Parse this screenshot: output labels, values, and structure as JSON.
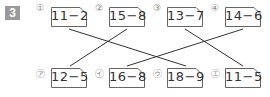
{
  "problem_number": "3",
  "top_cards": [
    {
      "label": "①",
      "expression": "11−2"
    },
    {
      "label": "②",
      "expression": "15−8"
    },
    {
      "label": "③",
      "expression": "13−7"
    },
    {
      "label": "④",
      "expression": "14−6"
    }
  ],
  "bottom_cards": [
    {
      "label": "㋐",
      "expression": "12−5"
    },
    {
      "label": "㋑",
      "expression": "16−8"
    },
    {
      "label": "㋒",
      "expression": "18−9"
    },
    {
      "label": "㋓",
      "expression": "11−5"
    }
  ],
  "connections": [
    {
      "from": "①",
      "to": "㋒"
    },
    {
      "from": "②",
      "to": "㋐"
    },
    {
      "from": "③",
      "to": "㋓"
    },
    {
      "from": "④",
      "to": "㋑"
    }
  ]
}
